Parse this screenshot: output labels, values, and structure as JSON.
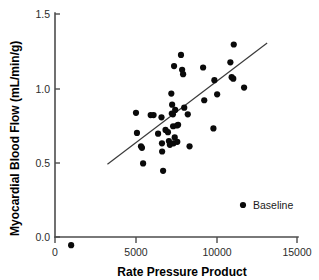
{
  "chart_data": {
    "type": "scatter",
    "title": "",
    "xlabel": "Rate Pressure Product",
    "ylabel": "Myocardial Blood Flow (mL/min/g)",
    "xlim": [
      0,
      15000
    ],
    "ylim": [
      0.0,
      1.5
    ],
    "xticks": [
      0,
      5000,
      10000,
      15000
    ],
    "xtick_labels": [
      "0",
      "5000",
      "10000",
      "15000"
    ],
    "yticks": [
      0.0,
      0.5,
      1.0,
      1.5
    ],
    "ytick_labels": [
      "0.0",
      "0.5",
      "1.0",
      "1.5"
    ],
    "grid": false,
    "legend_position": "lower-right",
    "series": [
      {
        "name": "Baseline",
        "marker": "circle",
        "color": "#0a0a0a",
        "points": [
          [
            5020,
            0.835
          ],
          [
            5080,
            0.7
          ],
          [
            5330,
            0.61
          ],
          [
            5390,
            0.6
          ],
          [
            5460,
            0.495
          ],
          [
            5930,
            0.82
          ],
          [
            6110,
            0.82
          ],
          [
            6390,
            0.695
          ],
          [
            6600,
            0.805
          ],
          [
            6630,
            0.63
          ],
          [
            6640,
            0.575
          ],
          [
            6700,
            0.445
          ],
          [
            6850,
            0.72
          ],
          [
            7000,
            0.705
          ],
          [
            7060,
            0.645
          ],
          [
            7120,
            0.62
          ],
          [
            7210,
            0.965
          ],
          [
            7240,
            0.83
          ],
          [
            7260,
            0.89
          ],
          [
            7310,
            0.825
          ],
          [
            7320,
            0.745
          ],
          [
            7350,
            0.63
          ],
          [
            7380,
            1.15
          ],
          [
            7420,
            0.67
          ],
          [
            7450,
            0.855
          ],
          [
            7560,
            0.75
          ],
          [
            7580,
            0.64
          ],
          [
            7630,
            0.755
          ],
          [
            7810,
            1.225
          ],
          [
            7880,
            1.125
          ],
          [
            7940,
            1.095
          ],
          [
            8010,
            0.87
          ],
          [
            8230,
            0.825
          ],
          [
            8340,
            0.61
          ],
          [
            9180,
            1.14
          ],
          [
            9250,
            0.92
          ],
          [
            9820,
            0.73
          ],
          [
            9880,
            1.055
          ],
          [
            10050,
            0.96
          ],
          [
            10870,
            1.175
          ],
          [
            10950,
            1.075
          ],
          [
            11050,
            1.065
          ],
          [
            11080,
            1.295
          ],
          [
            11720,
            1.005
          ],
          [
            1000,
            -0.055
          ]
        ]
      }
    ],
    "fit_line": {
      "name": "regression-line",
      "x_start": 3250,
      "y_start": 0.49,
      "x_end": 13150,
      "y_end": 1.305
    }
  },
  "legend": {
    "entries": [
      {
        "label": "Baseline",
        "marker": "circle",
        "color": "#0a0a0a"
      }
    ]
  },
  "colors": {
    "marker": "#0a0a0a",
    "axis": "#4d4d4d",
    "fit_line": "#3a3a3a",
    "background": "#ffffff",
    "text": "#000000"
  }
}
